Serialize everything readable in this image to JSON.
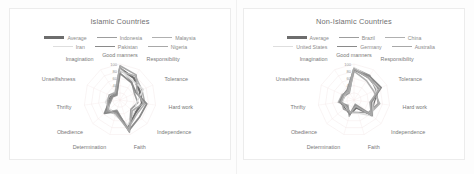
{
  "figure": {
    "background": "#ffffff",
    "panel_border": "#ececec"
  },
  "panels": [
    {
      "id": "islamic",
      "title": "Islamic Countries",
      "legend": [
        [
          {
            "label": "Average",
            "color": "#6d6d6d",
            "width": 2.2
          },
          {
            "label": "Indonesia",
            "color": "#9d9d9d",
            "width": 1.6
          },
          {
            "label": "Malaysia",
            "color": "#b0b0b0",
            "width": 1.6
          }
        ],
        [
          {
            "label": "Iran",
            "color": "#dedede",
            "width": 1.4
          },
          {
            "label": "Pakistan",
            "color": "#8a8a8a",
            "width": 1.8
          },
          {
            "label": "Nigeria",
            "color": "#a8a8a8",
            "width": 1.6
          }
        ]
      ],
      "chart_data": {
        "type": "radar",
        "title": "Islamic Countries",
        "categories": [
          "Good manners",
          "Responsibility",
          "Tolerance",
          "Hard work",
          "Independence",
          "Faith",
          "Determination",
          "Obedience",
          "Thrifty",
          "Unselfishness",
          "Imagination"
        ],
        "rlim": [
          0,
          100
        ],
        "rticks": [
          40,
          60,
          80,
          100
        ],
        "grid": true,
        "legend_position": "top",
        "series": [
          {
            "name": "Average",
            "color": "#6d6d6d",
            "width": 2.2,
            "values": [
              88,
              72,
              60,
              62,
              56,
              80,
              38,
              47,
              33,
              28,
              22
            ]
          },
          {
            "name": "Indonesia",
            "color": "#9d9d9d",
            "width": 1.6,
            "values": [
              92,
              60,
              44,
              50,
              40,
              93,
              30,
              52,
              26,
              22,
              16
            ]
          },
          {
            "name": "Malaysia",
            "color": "#b0b0b0",
            "width": 1.6,
            "values": [
              80,
              79,
              67,
              70,
              61,
              82,
              35,
              41,
              30,
              25,
              19
            ]
          },
          {
            "name": "Iran",
            "color": "#dedede",
            "width": 1.4,
            "values": [
              85,
              64,
              71,
              47,
              52,
              74,
              45,
              38,
              41,
              31,
              27
            ]
          },
          {
            "name": "Pakistan",
            "color": "#8a8a8a",
            "width": 1.8,
            "values": [
              74,
              58,
              49,
              75,
              72,
              88,
              33,
              57,
              30,
              24,
              18
            ]
          },
          {
            "name": "Nigeria",
            "color": "#a8a8a8",
            "width": 1.6,
            "values": [
              95,
              83,
              52,
              66,
              45,
              90,
              40,
              44,
              35,
              33,
              24
            ]
          }
        ]
      }
    },
    {
      "id": "non-islamic",
      "title": "Non-Islamic Countries",
      "legend": [
        [
          {
            "label": "Average",
            "color": "#6d6d6d",
            "width": 2.2
          },
          {
            "label": "Brazil",
            "color": "#9d9d9d",
            "width": 1.6
          },
          {
            "label": "China",
            "color": "#b0b0b0",
            "width": 1.6
          }
        ],
        [
          {
            "label": "United States",
            "color": "#dedede",
            "width": 1.4
          },
          {
            "label": "Germany",
            "color": "#8a8a8a",
            "width": 1.8
          },
          {
            "label": "Australia",
            "color": "#a8a8a8",
            "width": 1.6
          }
        ]
      ],
      "chart_data": {
        "type": "radar",
        "title": "Non-Islamic Countries",
        "categories": [
          "Good manners",
          "Responsibility",
          "Tolerance",
          "Hard work",
          "Independence",
          "Faith",
          "Determination",
          "Obedience",
          "Thrifty",
          "Unselfishness",
          "Imagination"
        ],
        "rlim": [
          0,
          100
        ],
        "rticks": [
          40,
          60,
          80,
          100
        ],
        "grid": true,
        "legend_position": "top",
        "series": [
          {
            "name": "Average",
            "color": "#6d6d6d",
            "width": 2.2,
            "values": [
              86,
              75,
              74,
              55,
              62,
              22,
              40,
              32,
              38,
              30,
              30
            ]
          },
          {
            "name": "Brazil",
            "color": "#9d9d9d",
            "width": 1.6,
            "values": [
              88,
              81,
              67,
              68,
              53,
              36,
              35,
              38,
              34,
              28,
              24
            ]
          },
          {
            "name": "China",
            "color": "#b0b0b0",
            "width": 1.6,
            "values": [
              80,
              64,
              60,
              72,
              58,
              12,
              47,
              22,
              44,
              36,
              26
            ]
          },
          {
            "name": "United States",
            "color": "#dedede",
            "width": 1.4,
            "values": [
              90,
              77,
              71,
              53,
              68,
              38,
              38,
              30,
              32,
              29,
              32
            ]
          },
          {
            "name": "Germany",
            "color": "#8a8a8a",
            "width": 1.8,
            "values": [
              84,
              79,
              83,
              48,
              66,
              15,
              42,
              26,
              40,
              33,
              34
            ]
          },
          {
            "name": "Australia",
            "color": "#a8a8a8",
            "width": 1.6,
            "values": [
              87,
              73,
              78,
              45,
              64,
              18,
              37,
              28,
              36,
              31,
              31
            ]
          }
        ]
      }
    }
  ]
}
